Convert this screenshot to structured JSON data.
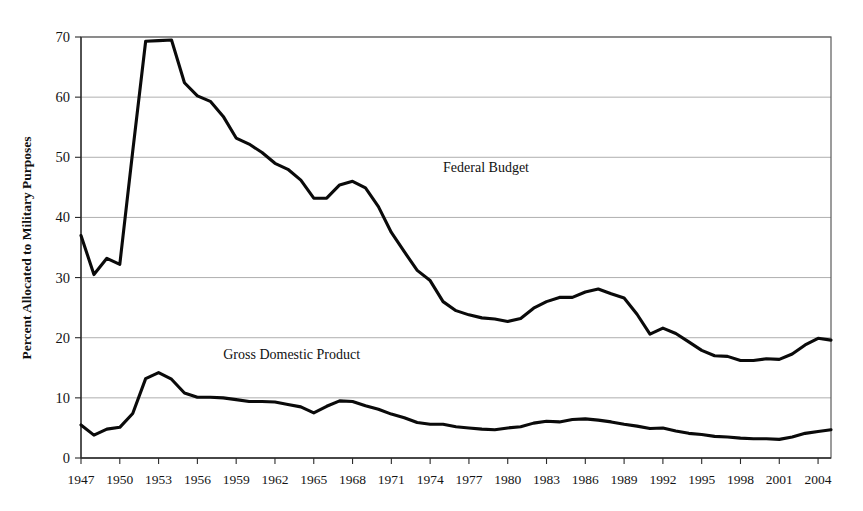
{
  "chart_data": {
    "type": "line",
    "title": "",
    "xlabel": "",
    "ylabel": "Percent Allocated to Military Purposes",
    "xlim": [
      1947,
      2005
    ],
    "ylim": [
      0,
      70
    ],
    "y_ticks": [
      0,
      10,
      20,
      30,
      40,
      50,
      60,
      70
    ],
    "x_ticks": [
      1947,
      1950,
      1953,
      1956,
      1959,
      1962,
      1965,
      1968,
      1971,
      1974,
      1977,
      1980,
      1983,
      1986,
      1989,
      1992,
      1995,
      1998,
      2001,
      2004
    ],
    "grid": true,
    "legend_position": "inline-annotation",
    "x": [
      1947,
      1948,
      1949,
      1950,
      1951,
      1952,
      1953,
      1954,
      1955,
      1956,
      1957,
      1958,
      1959,
      1960,
      1961,
      1962,
      1963,
      1964,
      1965,
      1966,
      1967,
      1968,
      1969,
      1970,
      1971,
      1972,
      1973,
      1974,
      1975,
      1976,
      1977,
      1978,
      1979,
      1980,
      1981,
      1982,
      1983,
      1984,
      1985,
      1986,
      1987,
      1988,
      1989,
      1990,
      1991,
      1992,
      1993,
      1994,
      1995,
      1996,
      1997,
      1998,
      1999,
      2000,
      2001,
      2002,
      2003,
      2004,
      2005
    ],
    "series": [
      {
        "name": "Federal Budget",
        "label": "Federal Budget",
        "label_x": 1975,
        "label_y": 47.5,
        "values": [
          37.0,
          30.5,
          33.2,
          32.2,
          51.0,
          69.3,
          69.4,
          69.5,
          62.4,
          60.2,
          59.3,
          56.8,
          53.2,
          52.2,
          50.8,
          49.0,
          48.0,
          46.2,
          43.2,
          43.2,
          45.4,
          46.0,
          44.9,
          41.8,
          37.5,
          34.3,
          31.2,
          29.5,
          26.0,
          24.5,
          23.8,
          23.3,
          23.1,
          22.7,
          23.2,
          24.9,
          26.0,
          26.7,
          26.7,
          27.6,
          28.1,
          27.3,
          26.6,
          23.9,
          20.6,
          21.6,
          20.7,
          19.3,
          17.9,
          17.0,
          16.9,
          16.2,
          16.2,
          16.5,
          16.4,
          17.3,
          18.8,
          19.9,
          19.6
        ]
      },
      {
        "name": "Gross Domestic Product",
        "label": "Gross Domestic Product",
        "label_x": 1958,
        "label_y": 16.5,
        "values": [
          5.5,
          3.8,
          4.8,
          5.1,
          7.4,
          13.2,
          14.2,
          13.1,
          10.8,
          10.1,
          10.1,
          10.0,
          9.7,
          9.4,
          9.4,
          9.3,
          8.9,
          8.5,
          7.5,
          8.6,
          9.5,
          9.4,
          8.7,
          8.1,
          7.3,
          6.7,
          5.9,
          5.6,
          5.6,
          5.2,
          5.0,
          4.8,
          4.7,
          5.0,
          5.2,
          5.8,
          6.1,
          6.0,
          6.4,
          6.5,
          6.3,
          6.0,
          5.6,
          5.3,
          4.9,
          5.0,
          4.5,
          4.1,
          3.9,
          3.6,
          3.5,
          3.3,
          3.2,
          3.2,
          3.1,
          3.5,
          4.1,
          4.4,
          4.7
        ]
      }
    ]
  }
}
